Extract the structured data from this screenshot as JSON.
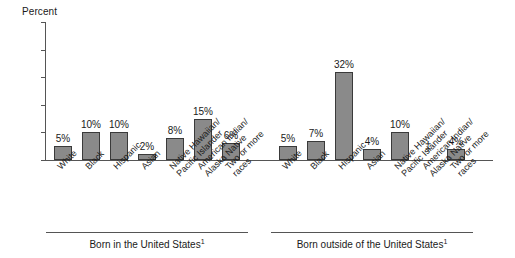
{
  "chart_data": {
    "type": "bar",
    "title": "",
    "ylabel": "Percent",
    "xlabel": "",
    "ylim": [
      0,
      50
    ],
    "yticks": [
      0,
      10,
      20,
      30,
      40,
      50
    ],
    "grid": false,
    "legend": null,
    "categories": [
      "White",
      "Black",
      "Hispanic",
      "Asian",
      "Native Hawaiian/ Pacific Islander",
      "American Indian/ Alaska Native",
      "Two or more races"
    ],
    "groups": [
      {
        "name": "Born in the United States",
        "caption": "Born in the United States",
        "footnote_marker": "1",
        "values": [
          5,
          10,
          10,
          2,
          8,
          15,
          6
        ],
        "labels": [
          "5%",
          "10%",
          "10%",
          "2%",
          "8%",
          "15%",
          "6%"
        ]
      },
      {
        "name": "Born outside of the United States",
        "caption": "Born outside of the United States",
        "footnote_marker": "1",
        "values": [
          5,
          7,
          32,
          4,
          10,
          null,
          4
        ],
        "labels": [
          "5%",
          "7%",
          "32%",
          "4%",
          "10%",
          "‡",
          "4%"
        ]
      }
    ],
    "suppressed_symbol": "‡",
    "bar_color": "#8a8a8a",
    "bar_border_color": "#3a3a3a",
    "axis_color": "#555555"
  },
  "category_lines": [
    [
      "White",
      ""
    ],
    [
      "Black",
      ""
    ],
    [
      "Hispanic",
      ""
    ],
    [
      "Asian",
      ""
    ],
    [
      "Native Hawaiian/",
      "Pacific Islander"
    ],
    [
      "American Indian/",
      "Alaska Native"
    ],
    [
      "Two or more",
      "races"
    ]
  ]
}
